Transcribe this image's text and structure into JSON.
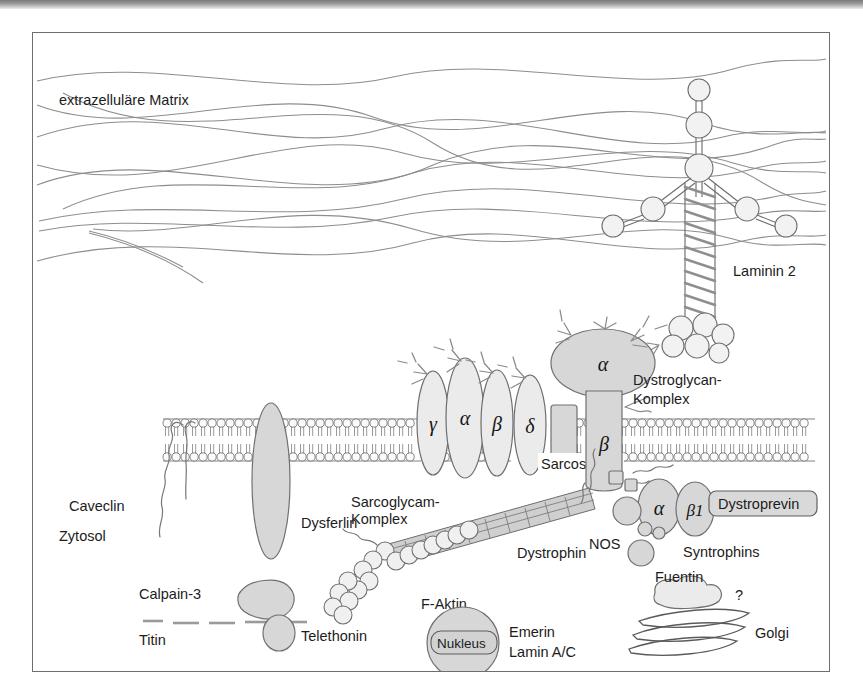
{
  "figure": {
    "compartments": {
      "extracellular": "extrazelluläre Matrix",
      "cytosol": "Zytosol"
    },
    "labels": {
      "laminin": "Laminin 2",
      "dystroglycan_complex_line1": "Dystroglycan-",
      "dystroglycan_complex_line2": "Komplex",
      "sarcoglycan_complex_line1": "Sarcoglycam-",
      "sarcoglycan_complex_line2": "Komplex",
      "sarcospan": "Sarcospan",
      "caveolin": "Caveclin",
      "dysferlin": "Dysferlin",
      "dystrophin": "Dystrophin",
      "f_actin": "F-Aktin",
      "calpain": "Calpain-3",
      "titin": "Titin",
      "telethonin": "Telethonin",
      "nos": "NOS",
      "syntrophins": "Syntrophins",
      "dystrobrevin": "Dystroprevin",
      "fuentin": "Fuentin",
      "question_mark": "?",
      "golgi": "Golgi",
      "nucleus": "Nukleus",
      "emerin": "Emerin",
      "lamin": "Lamin A/C"
    },
    "subunits": {
      "sarcoglycan_gamma": "γ",
      "sarcoglycan_alpha": "α",
      "sarcoglycan_beta": "β",
      "sarcoglycan_delta": "δ",
      "dystroglycan_alpha": "α",
      "dystroglycan_beta": "β",
      "syntrophin_alpha": "α",
      "syntrophin_beta1": "β1"
    },
    "colors": {
      "fill_gray": "#d7d7d7",
      "fill_light": "#ebebeb",
      "stroke_gray": "#6e6e6e",
      "fiber_gray": "#8d8d8d",
      "text": "#1c1c1c",
      "background": "#ffffff",
      "frame": "#6e6e6e"
    }
  }
}
